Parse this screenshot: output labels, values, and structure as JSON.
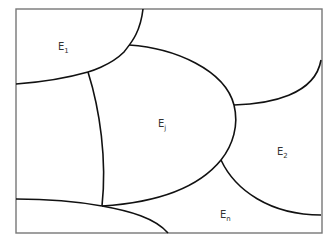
{
  "diagram": {
    "type": "partition-of-region",
    "regions": [
      {
        "id": "E1",
        "base": "E",
        "subscript": "1"
      },
      {
        "id": "Ej",
        "base": "E",
        "subscript": "j"
      },
      {
        "id": "E2",
        "base": "E",
        "subscript": "2"
      },
      {
        "id": "En",
        "base": "E",
        "subscript": "n"
      }
    ]
  }
}
